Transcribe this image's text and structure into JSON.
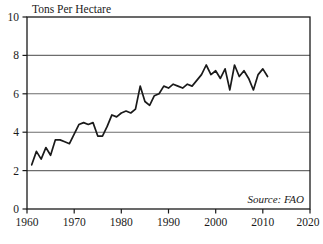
{
  "chart_data": {
    "type": "line",
    "title": "",
    "ylabel": "Tons Per Hectare",
    "xlabel": "",
    "xlim": [
      1960,
      2020
    ],
    "ylim": [
      0,
      10
    ],
    "xticks": [
      "1960",
      "1970",
      "1980",
      "1990",
      "2000",
      "2010",
      "2020"
    ],
    "xtick_values": [
      1960,
      1970,
      1980,
      1990,
      2000,
      2010,
      2020
    ],
    "yticks": [
      "0",
      "2",
      "4",
      "6",
      "8",
      "10"
    ],
    "ytick_values": [
      0,
      2,
      4,
      6,
      8,
      10
    ],
    "grid": "horizontal",
    "gridline_values": [
      2,
      4,
      6,
      8
    ],
    "legend": "none",
    "line_color": "#1a1a1a",
    "annotation": "Source: FAO",
    "series": [
      {
        "name": "Tons Per Hectare",
        "x": [
          1961,
          1962,
          1963,
          1964,
          1965,
          1966,
          1967,
          1968,
          1969,
          1970,
          1971,
          1972,
          1973,
          1974,
          1975,
          1976,
          1977,
          1978,
          1979,
          1980,
          1981,
          1982,
          1983,
          1984,
          1985,
          1986,
          1987,
          1988,
          1989,
          1990,
          1991,
          1992,
          1993,
          1994,
          1995,
          1996,
          1997,
          1998,
          1999,
          2000,
          2001,
          2002,
          2003,
          2004,
          2005,
          2006,
          2007,
          2008,
          2009,
          2010,
          2011
        ],
        "y": [
          2.3,
          3.0,
          2.6,
          3.2,
          2.8,
          3.6,
          3.6,
          3.5,
          3.4,
          3.9,
          4.4,
          4.5,
          4.4,
          4.5,
          3.8,
          3.8,
          4.3,
          4.9,
          4.8,
          5.0,
          5.1,
          5.0,
          5.2,
          6.4,
          5.6,
          5.4,
          5.9,
          6.0,
          6.4,
          6.3,
          6.5,
          6.4,
          6.3,
          6.5,
          6.4,
          6.7,
          7.0,
          7.5,
          7.0,
          7.2,
          6.8,
          7.3,
          6.2,
          7.5,
          6.9,
          7.2,
          6.8,
          6.2,
          7.0,
          7.3,
          6.9
        ]
      }
    ]
  },
  "axes": {
    "ylabel": "Tons Per Hectare",
    "source_note": "Source: FAO",
    "ytick_0": "0",
    "ytick_2": "2",
    "ytick_4": "4",
    "ytick_6": "6",
    "ytick_8": "8",
    "ytick_10": "10",
    "xtick_1960": "1960",
    "xtick_1970": "1970",
    "xtick_1980": "1980",
    "xtick_1990": "1990",
    "xtick_2000": "2000",
    "xtick_2010": "2010",
    "xtick_2020": "2020"
  }
}
